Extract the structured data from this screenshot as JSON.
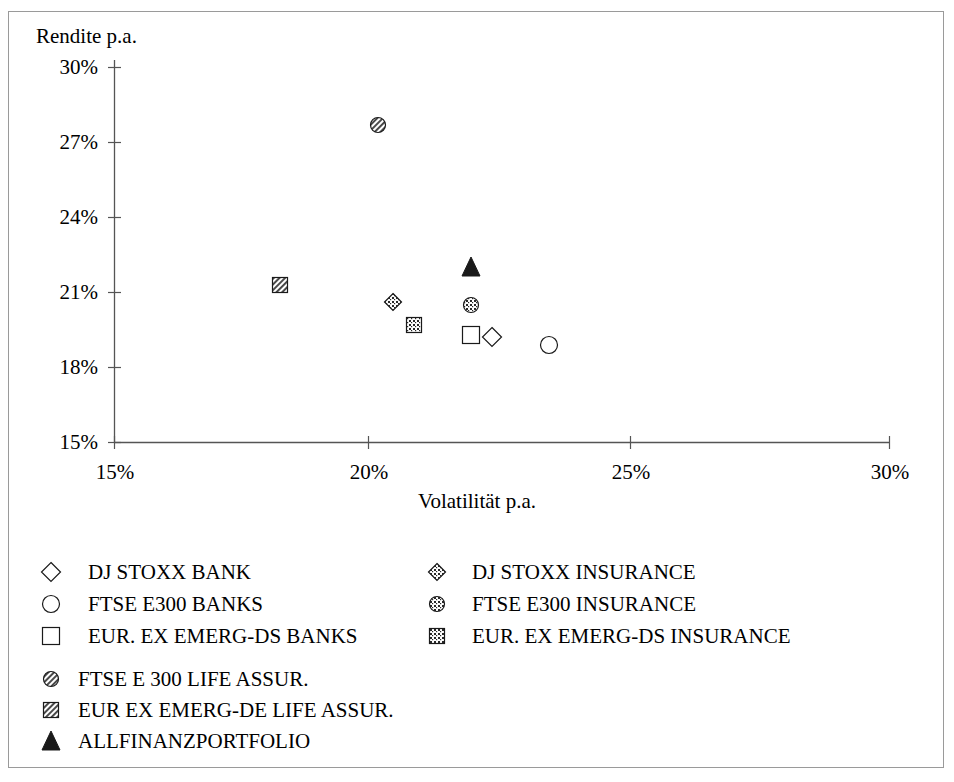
{
  "chart_data": {
    "type": "scatter",
    "title": "",
    "xlabel": "Volatilität p.a.",
    "ylabel": "Rendite p.a.",
    "xlim": [
      15,
      30
    ],
    "ylim": [
      15,
      30
    ],
    "xticks": [
      "15%",
      "20%",
      "25%",
      "30%"
    ],
    "yticks": [
      "30%",
      "27%",
      "24%",
      "21%",
      "18%",
      "15%"
    ],
    "grid": false,
    "legend_position": "below",
    "points": [
      {
        "name": "DJ STOXX BANK",
        "marker": "open-diamond",
        "x": 22.3,
        "y": 19.2
      },
      {
        "name": "FTSE E300 BANKS",
        "marker": "open-circle",
        "x": 23.4,
        "y": 18.9
      },
      {
        "name": "EUR. EX EMERG-DS BANKS",
        "marker": "open-square",
        "x": 21.9,
        "y": 19.3
      },
      {
        "name": "DJ STOXX INSURANCE",
        "marker": "speckled-diamond",
        "x": 20.4,
        "y": 20.6
      },
      {
        "name": "FTSE E300 INSURANCE",
        "marker": "speckled-circle",
        "x": 21.9,
        "y": 20.5
      },
      {
        "name": "EUR. EX EMERG-DS INSURANCE",
        "marker": "speckled-square",
        "x": 20.8,
        "y": 19.7
      },
      {
        "name": "FTSE E 300 LIFE ASSUR.",
        "marker": "hatched-circle",
        "x": 20.1,
        "y": 27.7
      },
      {
        "name": "EUR EX EMERG-DE LIFE ASSUR.",
        "marker": "hatched-square",
        "x": 18.2,
        "y": 21.3
      },
      {
        "name": "ALLFINANZPORTFOLIO",
        "marker": "filled-triangle",
        "x": 21.9,
        "y": 22.0
      }
    ]
  },
  "axes": {
    "y_axis_title": "Rendite p.a.",
    "x_axis_title": "Volatilität p.a.",
    "y_ticks": [
      "30%",
      "27%",
      "24%",
      "21%",
      "18%",
      "15%"
    ],
    "x_ticks": [
      "15%",
      "20%",
      "25%",
      "30%"
    ]
  },
  "legend": {
    "column1": [
      {
        "label": "DJ STOXX BANK",
        "marker": "open-diamond"
      },
      {
        "label": "FTSE E300 BANKS",
        "marker": "open-circle"
      },
      {
        "label": "EUR. EX EMERG-DS BANKS",
        "marker": "open-square"
      }
    ],
    "column2": [
      {
        "label": "DJ STOXX INSURANCE",
        "marker": "speckled-diamond"
      },
      {
        "label": "FTSE E300 INSURANCE",
        "marker": "speckled-circle"
      },
      {
        "label": "EUR. EX EMERG-DS INSURANCE",
        "marker": "speckled-square"
      }
    ],
    "bottom": [
      {
        "label": "FTSE E 300 LIFE ASSUR.",
        "marker": "hatched-circle"
      },
      {
        "label": "EUR EX EMERG-DE LIFE ASSUR.",
        "marker": "hatched-square"
      },
      {
        "label": "ALLFINANZPORTFOLIO",
        "marker": "filled-triangle"
      }
    ]
  },
  "colors": {
    "ink": "#1a1a1a",
    "axis": "#555555",
    "frame": "#9a9a9a",
    "background": "#ffffff"
  }
}
